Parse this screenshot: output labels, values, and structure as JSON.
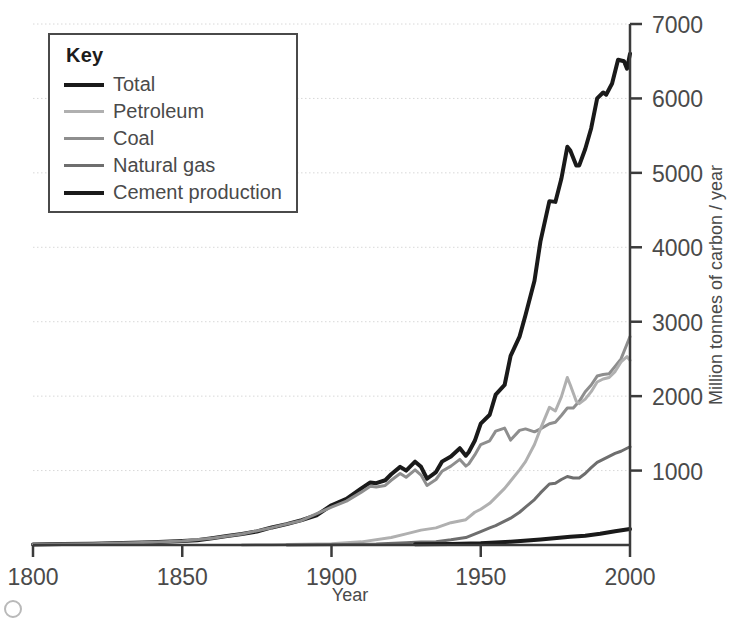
{
  "legend": {
    "title": "Key",
    "entries": [
      {
        "label": "Total",
        "color": "#1a1a1a",
        "width": 4
      },
      {
        "label": "Petroleum",
        "color": "#b0b0b0",
        "width": 3
      },
      {
        "label": "Coal",
        "color": "#8e8e8e",
        "width": 3
      },
      {
        "label": "Natural gas",
        "color": "#6e6e6e",
        "width": 3
      },
      {
        "label": "Cement production",
        "color": "#1a1a1a",
        "width": 4
      }
    ]
  },
  "chart_data": {
    "type": "line",
    "title": "",
    "xlabel": "Year",
    "ylabel": "Million tonnes of carbon / year",
    "xlim": [
      1800,
      2000
    ],
    "ylim": [
      0,
      7000
    ],
    "xticks": [
      1800,
      1850,
      1900,
      1950,
      2000
    ],
    "yticks": [
      1000,
      2000,
      3000,
      4000,
      5000,
      6000,
      7000
    ],
    "grid": "horizontal-dotted",
    "legend_position": "top-left",
    "series": [
      {
        "name": "Total",
        "color": "#1a1a1a",
        "width": 4,
        "x": [
          1800,
          1810,
          1820,
          1830,
          1840,
          1850,
          1855,
          1860,
          1865,
          1870,
          1875,
          1880,
          1885,
          1890,
          1895,
          1900,
          1905,
          1910,
          1913,
          1915,
          1918,
          1920,
          1923,
          1925,
          1928,
          1930,
          1932,
          1935,
          1937,
          1940,
          1943,
          1945,
          1946,
          1948,
          1950,
          1953,
          1955,
          1958,
          1960,
          1963,
          1965,
          1968,
          1970,
          1973,
          1975,
          1977,
          1979,
          1980,
          1982,
          1983,
          1985,
          1987,
          1989,
          1991,
          1992,
          1994,
          1996,
          1998,
          1999,
          2000
        ],
        "y": [
          8,
          12,
          18,
          26,
          38,
          54,
          64,
          91,
          120,
          147,
          182,
          236,
          280,
          334,
          400,
          534,
          620,
          760,
          840,
          830,
          870,
          950,
          1050,
          1000,
          1120,
          1050,
          890,
          980,
          1120,
          1190,
          1300,
          1200,
          1250,
          1400,
          1630,
          1750,
          2020,
          2150,
          2540,
          2800,
          3090,
          3550,
          4080,
          4620,
          4610,
          4920,
          5350,
          5300,
          5100,
          5100,
          5320,
          5600,
          6000,
          6080,
          6050,
          6200,
          6520,
          6500,
          6400,
          6600
        ]
      },
      {
        "name": "Coal",
        "color": "#8e8e8e",
        "width": 3,
        "x": [
          1800,
          1810,
          1820,
          1830,
          1840,
          1850,
          1860,
          1870,
          1880,
          1890,
          1900,
          1905,
          1910,
          1913,
          1915,
          1918,
          1920,
          1923,
          1925,
          1928,
          1930,
          1932,
          1935,
          1937,
          1940,
          1943,
          1945,
          1946,
          1948,
          1950,
          1953,
          1955,
          1958,
          1960,
          1963,
          1965,
          1968,
          1970,
          1973,
          1975,
          1977,
          1979,
          1981,
          1983,
          1985,
          1987,
          1989,
          1991,
          1993,
          1995,
          1997,
          1999,
          2000
        ],
        "y": [
          8,
          12,
          18,
          26,
          38,
          54,
          90,
          147,
          233,
          330,
          510,
          590,
          710,
          790,
          780,
          800,
          870,
          960,
          910,
          1010,
          940,
          800,
          880,
          990,
          1060,
          1150,
          1060,
          1090,
          1210,
          1350,
          1400,
          1530,
          1570,
          1410,
          1540,
          1560,
          1520,
          1560,
          1630,
          1650,
          1740,
          1840,
          1840,
          1930,
          2060,
          2150,
          2270,
          2290,
          2300,
          2400,
          2500,
          2700,
          2800
        ]
      },
      {
        "name": "Petroleum",
        "color": "#b0b0b0",
        "width": 3,
        "x": [
          1870,
          1880,
          1890,
          1900,
          1910,
          1920,
          1925,
          1930,
          1935,
          1940,
          1945,
          1948,
          1950,
          1953,
          1955,
          1958,
          1960,
          1963,
          1965,
          1968,
          1970,
          1973,
          1975,
          1977,
          1979,
          1980,
          1982,
          1983,
          1985,
          1987,
          1989,
          1991,
          1993,
          1995,
          1997,
          1999,
          2000
        ],
        "y": [
          1,
          4,
          10,
          18,
          42,
          100,
          150,
          200,
          230,
          300,
          340,
          440,
          480,
          560,
          640,
          760,
          860,
          1010,
          1120,
          1350,
          1560,
          1850,
          1800,
          1990,
          2250,
          2150,
          1930,
          1900,
          1960,
          2060,
          2190,
          2230,
          2250,
          2330,
          2460,
          2530,
          2480
        ]
      },
      {
        "name": "Natural gas",
        "color": "#6e6e6e",
        "width": 3,
        "x": [
          1885,
          1895,
          1905,
          1915,
          1925,
          1930,
          1935,
          1940,
          1945,
          1950,
          1953,
          1955,
          1958,
          1960,
          1963,
          1965,
          1968,
          1970,
          1973,
          1975,
          1977,
          1979,
          1981,
          1983,
          1985,
          1987,
          1989,
          1991,
          1993,
          1995,
          1997,
          1999,
          2000
        ],
        "y": [
          1,
          3,
          8,
          14,
          30,
          40,
          45,
          70,
          100,
          180,
          230,
          260,
          320,
          360,
          440,
          510,
          610,
          700,
          820,
          830,
          880,
          920,
          900,
          900,
          960,
          1040,
          1110,
          1150,
          1190,
          1230,
          1260,
          1300,
          1320
        ]
      },
      {
        "name": "Cement production",
        "color": "#1a1a1a",
        "width": 4,
        "x": [
          1928,
          1940,
          1950,
          1960,
          1970,
          1980,
          1985,
          1990,
          1995,
          2000
        ],
        "y": [
          10,
          15,
          25,
          45,
          75,
          110,
          125,
          150,
          185,
          215
        ]
      }
    ]
  },
  "axes": {
    "x_tick_labels": [
      "1800",
      "1850",
      "1900",
      "1950",
      "2000"
    ],
    "y_tick_labels": [
      "1000",
      "2000",
      "3000",
      "4000",
      "5000",
      "6000",
      "7000"
    ],
    "x_axis_title": "Year",
    "y_axis_title": "Million tonnes of carbon / year"
  }
}
